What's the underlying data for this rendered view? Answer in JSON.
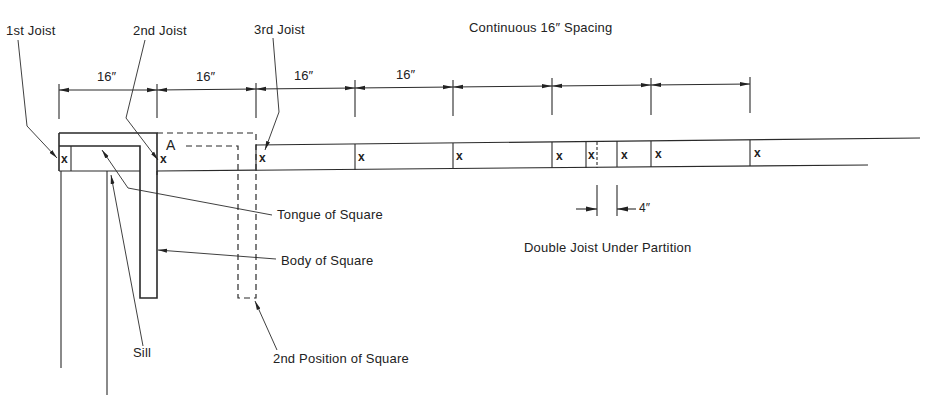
{
  "diagram": {
    "labels": {
      "joist_1": "1st Joist",
      "joist_2": "2nd Joist",
      "joist_3": "3rd Joist",
      "continuous": "Continuous 16″ Spacing",
      "point_a": "A",
      "tongue": "Tongue of Square",
      "body": "Body of Square",
      "sill": "Sill",
      "second_position": "2nd Position of Square",
      "double_joist": "Double Joist Under Partition",
      "partition_gap": "4″"
    },
    "dimensions": [
      "16″",
      "16″",
      "16″",
      "16″"
    ],
    "joist_marks": [
      "x",
      "x",
      "x",
      "x",
      "x",
      "x",
      "x",
      "x",
      "x",
      "x"
    ],
    "colors": {
      "line": "#2a2a2a",
      "background": "#ffffff"
    }
  }
}
